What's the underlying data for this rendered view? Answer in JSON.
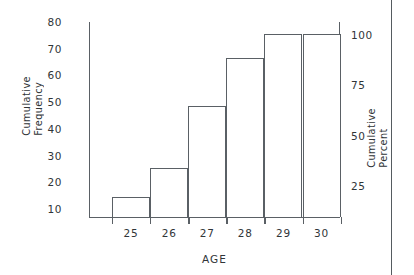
{
  "chart_data": {
    "type": "bar",
    "title": "",
    "subtitle": "",
    "xlabel": "AGE",
    "ylabel": "Cumulative Frequency",
    "y2label": "Cumulative Percent",
    "categories": [
      "25",
      "26",
      "27",
      "28",
      "29",
      "30"
    ],
    "values": [
      14,
      25,
      48,
      66,
      75,
      75
    ],
    "series": [
      {
        "name": "Cumulative Frequency",
        "values": [
          14,
          25,
          48,
          66,
          75,
          75
        ]
      },
      {
        "name": "Cumulative Percent",
        "values": [
          18.7,
          33.3,
          64.0,
          88.0,
          100,
          100
        ]
      }
    ],
    "ylim": [
      0,
      80
    ],
    "yticks": [
      80,
      70,
      60,
      50,
      40,
      30,
      20,
      10
    ],
    "y2lim": [
      0,
      101.3
    ],
    "y2ticks": [
      100,
      75,
      50,
      25
    ],
    "grid": false,
    "legend": false,
    "legend_position": "none",
    "bar_style": "outline",
    "bar_fill": "#ffffff",
    "bar_edge_color": "#5a6065",
    "axis_color": "#5a6065",
    "text_color": "#303538",
    "background": "#ffffff"
  },
  "axes": {
    "left": {
      "title_line1": "Cumulative",
      "title_line2": "Frequency",
      "ticks": [
        "80",
        "70",
        "60",
        "50",
        "40",
        "30",
        "20",
        "10"
      ]
    },
    "right": {
      "title_line1": "Cumulative",
      "title_line2": "Percent",
      "ticks": [
        "100",
        "75",
        "50",
        "25"
      ]
    },
    "bottom": {
      "title": "AGE",
      "ticks": [
        "25",
        "26",
        "27",
        "28",
        "29",
        "30"
      ]
    }
  }
}
